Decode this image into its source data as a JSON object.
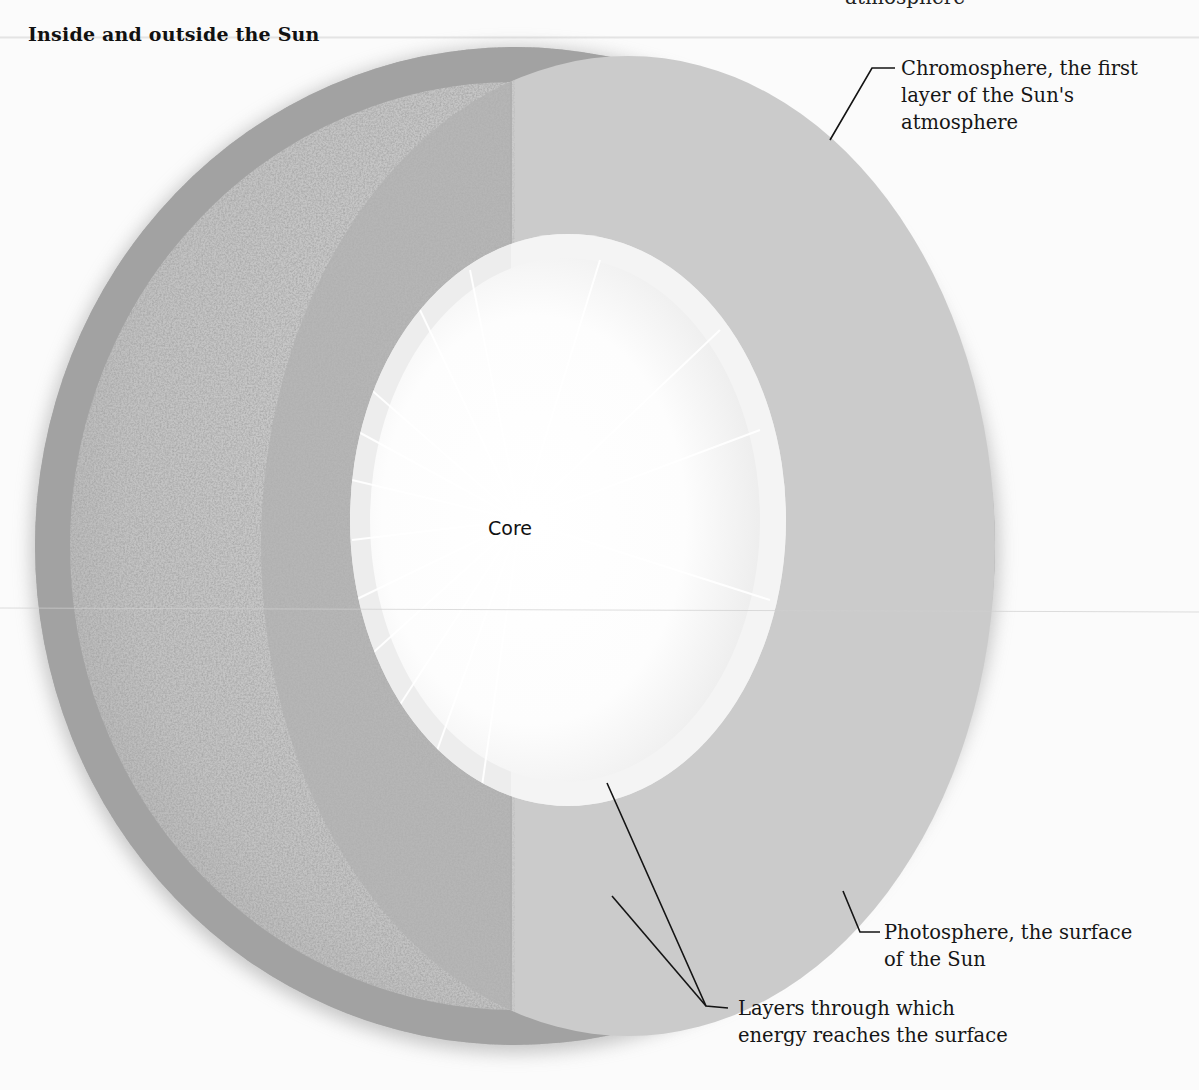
{
  "figure": {
    "title": "Inside and outside the Sun",
    "clipped_top_text": "atmosphere"
  },
  "labels": {
    "core": "Core",
    "chromosphere": {
      "line1": "Chromosphere, the first",
      "line2": "layer of the Sun's",
      "line3": "atmosphere"
    },
    "photosphere": {
      "line1": "Photosphere, the surface",
      "line2": "of the Sun"
    },
    "layers": {
      "line1": "Layers through which",
      "line2": "energy reaches the surface"
    }
  },
  "colors": {
    "background": "#fbfbfb",
    "surface_texture": "#b9b9b9",
    "outer_layer_dark": "#b3b3b3",
    "outer_layer_light": "#c9c9c9",
    "chromosphere_ring": "#a4a4a4",
    "core": "#ffffff",
    "leader_line": "#141414"
  }
}
